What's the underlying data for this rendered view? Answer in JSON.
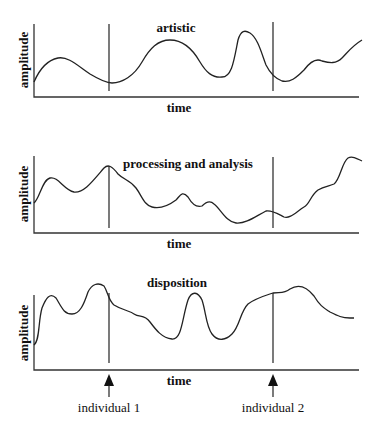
{
  "panels": [
    {
      "title": "artistic",
      "ylabel": "amplitude",
      "xlabel": "time"
    },
    {
      "title": "processing and analysis",
      "ylabel": "amplitude",
      "xlabel": "time"
    },
    {
      "title": "disposition",
      "ylabel": "amplitude",
      "xlabel": "time"
    }
  ],
  "markers": [
    {
      "label": "individual 1"
    },
    {
      "label": "individual 2"
    }
  ],
  "colors": {
    "line": "#222222",
    "background": "#ffffff"
  }
}
